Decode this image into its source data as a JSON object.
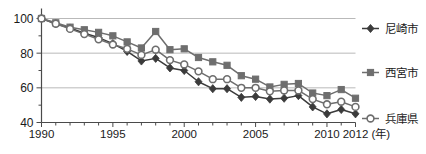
{
  "chart_data": {
    "type": "line",
    "title": "",
    "subtitle": "",
    "xlabel": "(年)",
    "ylabel": "",
    "xlim": [
      1990,
      2012
    ],
    "ylim": [
      40,
      100
    ],
    "grid": true,
    "gridlines_y": [
      60,
      80,
      100
    ],
    "legend_position": "right",
    "x": [
      1990,
      1991,
      1992,
      1993,
      1994,
      1995,
      1996,
      1997,
      1998,
      1999,
      2000,
      2001,
      2002,
      2003,
      2004,
      2005,
      2006,
      2007,
      2008,
      2009,
      2010,
      2011,
      2012
    ],
    "xticks": [
      1990,
      1995,
      2000,
      2005,
      2010,
      2012
    ],
    "xtick_labels": [
      "1990",
      "1995",
      "2000",
      "2005",
      "2010",
      "2012"
    ],
    "yticks": [
      40,
      60,
      80,
      100
    ],
    "ytick_labels": [
      "40",
      "60",
      "80",
      "100"
    ],
    "yticks_minor": [
      50,
      70,
      90
    ],
    "series": [
      {
        "name": "尼崎市",
        "marker": "diamond",
        "color": "#3b3b3b",
        "values": [
          100,
          97,
          94.5,
          91.5,
          89,
          85.5,
          81,
          75.5,
          77,
          71.5,
          70,
          63.5,
          59.5,
          59.5,
          54.5,
          55,
          53.5,
          54,
          55.5,
          49,
          45,
          47.5,
          45
        ]
      },
      {
        "name": "西宮市",
        "marker": "square",
        "color": "#6e6e6e",
        "values": [
          100,
          97.5,
          95,
          93.5,
          92,
          90,
          86.5,
          83,
          92.5,
          82,
          82.5,
          77.5,
          75,
          73,
          67,
          65,
          60.5,
          62,
          62.5,
          57,
          55.5,
          59,
          54
        ]
      },
      {
        "name": "兵庫県",
        "marker": "circle",
        "color": "#6e6e6e",
        "values": [
          100,
          97,
          94,
          91,
          88,
          85,
          82.5,
          79,
          82,
          76,
          73.5,
          69.5,
          65,
          65,
          60,
          60,
          58,
          58.5,
          58.5,
          53.5,
          50.5,
          52,
          49
        ]
      }
    ]
  },
  "legend": {
    "items": [
      {
        "label": "尼崎市",
        "marker": "diamond"
      },
      {
        "label": "西宮市",
        "marker": "square"
      },
      {
        "label": "兵庫県",
        "marker": "circle"
      }
    ]
  },
  "axis": {
    "x_unit_label": "(年)"
  }
}
